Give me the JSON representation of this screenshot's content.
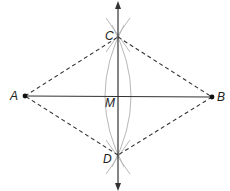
{
  "diagram": {
    "points": {
      "A": {
        "label": "A",
        "x": 25,
        "y": 96
      },
      "B": {
        "label": "B",
        "x": 212,
        "y": 97
      },
      "C": {
        "label": "C",
        "x": 118,
        "y": 37
      },
      "D": {
        "label": "D",
        "x": 118,
        "y": 155
      },
      "M": {
        "label": "M",
        "x": 118,
        "y": 96
      }
    },
    "colors": {
      "line": "#333333",
      "dashed": "#333333",
      "arc": "#b5b5b5",
      "point": "#111111"
    }
  }
}
